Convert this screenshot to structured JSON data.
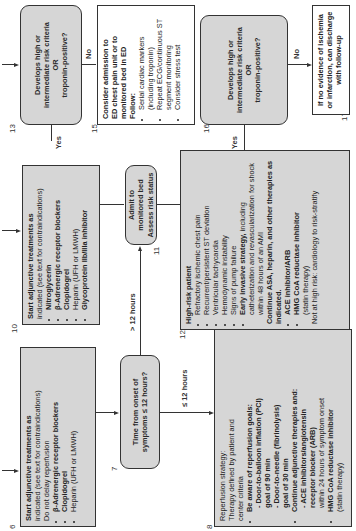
{
  "diagram": {
    "orientation": "rotated 90° counterclockwise",
    "boxes": {
      "b6": {
        "number": "6",
        "title": "Start adjunctive treatments as",
        "lines": [
          "indicated (see text for contraindications)",
          "Do not delay reperfusion"
        ],
        "bullets": [
          "β-Adrenergic receptor blockers",
          "Clopidogrel",
          "Heparin (UFH or LMWH)"
        ]
      },
      "b7": {
        "number": "7",
        "line1": "Time from onset of",
        "line2": "symptoms ≤ 12 hours?"
      },
      "b8": {
        "number": "8",
        "title": "Reperfusion strategy:",
        "lines": [
          "Therapy defined by patient and",
          "center criteria"
        ],
        "bullet1": "Be aware of reperfusion goals:",
        "sub1": [
          "- Door-to-balloon inflation (PCI)",
          "goal of 90 min",
          "- Door-to-needle (fibrinolysis)",
          "goal of 30 min"
        ],
        "bullet2": "Continue adjunctive therapies and:",
        "sub2a": [
          "- ACE inhibitors/angiotensin",
          "receptor blocker (ARB)"
        ],
        "sub2b": "within 24 hours of symptom onset",
        "bullet3": "HMG CoA reductase inhibitor",
        "bullet3_note": "(statin therapy)"
      },
      "b10": {
        "number": "10",
        "title": "Start adjunctive treatments as",
        "lines": [
          "indicated (see text for contraindications)"
        ],
        "bullets": [
          "Nitroglycerin",
          "β-Adrenergic receptor blockers",
          "Clopidogrel",
          "Heparin (UFH or LMWH)",
          "Glycoprotein IIb/IIIa inhibitor"
        ]
      },
      "b11": {
        "number": "11",
        "line1": "Admit to monitored bed",
        "line2": "Assess risk status"
      },
      "b12": {
        "number": "12",
        "title": "High-risk patient",
        "bullets": [
          "Refractory ischemic chest pain",
          "Recurrent/persistent ST deviation",
          "Ventricular tachycardia",
          "Hemodynamic instability",
          "Signs of pump failure"
        ],
        "early_bold": "Early invasive strategy,",
        "early_rest": "including catheterization and revascularization for shock within 48 hours of an AMI",
        "continue": "Continue ASA, heparin, and other therapies as indicated.",
        "bullets2": [
          "ACE inhibitor/ARB",
          "HMG CoA reductase inhibitor"
        ],
        "statin_note": "(statin therapy)",
        "footer": "Not at high risk: cardiology to risk-stratify"
      },
      "b13": {
        "number": "13",
        "line1": "Develops high or",
        "line2": "intermediate risk criteria",
        "line3": "OR",
        "line4": "troponin-positive?"
      },
      "b15": {
        "number": "15",
        "lines": [
          "Consider admission to",
          "ED chest pain unit or to",
          "monitored  bed in ED"
        ],
        "follow": "Follow:",
        "bullets": [
          "Serial cardiac markers (including troponin)",
          "Repeat ECG/continuous ST segment monitoring",
          "Consider stress test"
        ]
      },
      "b16": {
        "number": "16",
        "line1": "Develops high or",
        "line2": "intermediate risk criteria",
        "line3": "OR",
        "line4": "troponin-positive?"
      },
      "b17": {
        "number": "17",
        "line1": "If no evidence of ischemia",
        "line2": "or infarction, can discharge",
        "line3": "with follow-up"
      }
    },
    "edge_labels": {
      "le12": "≤ 12 hours",
      "gt12": "> 12 hours",
      "yes13": "Yes",
      "no13": "No",
      "yes16": "Yes",
      "no16": "No"
    },
    "colors": {
      "shaded": "#d6d6d6",
      "border": "#333333",
      "text": "#222222"
    }
  }
}
